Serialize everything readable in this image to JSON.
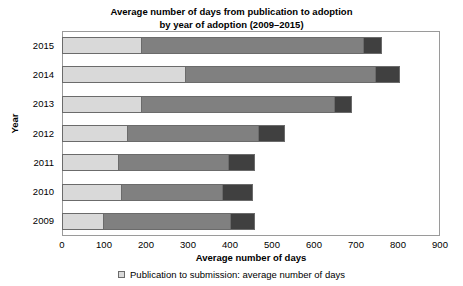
{
  "chart_data": {
    "type": "bar",
    "orientation": "horizontal",
    "stacked": true,
    "title": "Average number of days from publication to adoption by year of adoption (2009–2015)",
    "title_lines": [
      "Average number of days from publication to adoption",
      "by year of adoption (2009–2015)"
    ],
    "xlabel": "Average number of days",
    "ylabel": "Year",
    "categories": [
      "2015",
      "2014",
      "2013",
      "2012",
      "2011",
      "2010",
      "2009"
    ],
    "xlim": [
      0,
      900
    ],
    "xticks": [
      0,
      100,
      200,
      300,
      400,
      500,
      600,
      700,
      800,
      900
    ],
    "grid": false,
    "legend_position": "bottom",
    "legend": [
      {
        "name": "Publication to submission: average number of days",
        "color": "#d9d9d9"
      }
    ],
    "series": [
      {
        "name": "Publication to submission: average number of days",
        "color": "#d9d9d9",
        "values": [
          188,
          293,
          188,
          155,
          133,
          140,
          98
        ]
      },
      {
        "name": "Segment 2",
        "color": "#808080",
        "values": [
          529,
          452,
          460,
          312,
          262,
          241,
          302
        ]
      },
      {
        "name": "Segment 3",
        "color": "#404040",
        "values": [
          45,
          60,
          42,
          64,
          65,
          74,
          60
        ]
      }
    ],
    "totals": [
      762,
      805,
      690,
      531,
      460,
      455,
      460
    ]
  }
}
